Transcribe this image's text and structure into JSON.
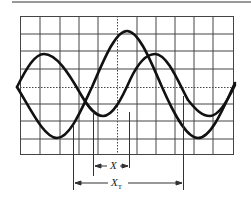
{
  "figure": {
    "type": "oscilloscope-phase-measurement",
    "grid": {
      "columns": 11,
      "rows": 8,
      "center_lines": "dotted"
    },
    "waveforms": [
      {
        "name": "waveform-a",
        "description": "larger amplitude sine, starts at center going down"
      },
      {
        "name": "waveform-b",
        "description": "smaller amplitude sine, starts at center going up"
      }
    ],
    "labels": {
      "x": "X",
      "xt_main": "X",
      "xt_sub": "T"
    },
    "colors": {
      "trace": "#111111",
      "grid": "#333333",
      "background": "#ffffff"
    }
  }
}
